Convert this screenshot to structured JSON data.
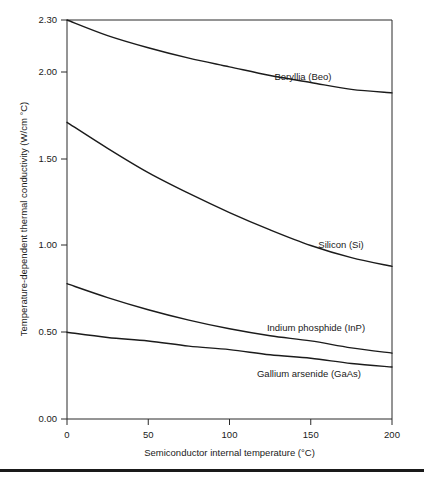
{
  "chart_data": {
    "type": "line",
    "title": "",
    "xlabel": "Semiconductor internal temperature (°C)",
    "ylabel": "Temperature-dependent thermal conductivity (W/cm °C)",
    "xlim": [
      0,
      200
    ],
    "ylim": [
      0.0,
      2.3
    ],
    "grid": false,
    "legend_position": "inline-right-of-curve",
    "xticks": [
      0,
      50,
      100,
      150,
      200
    ],
    "xtick_labels": [
      "0",
      "50",
      "100",
      "150",
      "200"
    ],
    "yticks": [
      0.0,
      0.5,
      1.0,
      1.5,
      2.0,
      2.3
    ],
    "ytick_labels": [
      "0.00",
      "0.50",
      "1.00",
      "1.50",
      "2.00",
      "2.30"
    ],
    "x": [
      0,
      25,
      50,
      75,
      100,
      125,
      150,
      175,
      200
    ],
    "series": [
      {
        "name": "Beryllia (Beo)",
        "label": "Beryllia (Beo)",
        "values": [
          2.3,
          2.21,
          2.14,
          2.08,
          2.03,
          1.98,
          1.94,
          1.9,
          1.88
        ]
      },
      {
        "name": "Silicon (Si)",
        "label": "Silicon (Si)",
        "values": [
          1.71,
          1.56,
          1.42,
          1.3,
          1.19,
          1.09,
          1.0,
          0.93,
          0.88
        ]
      },
      {
        "name": "Indium phosphide (InP)",
        "label": "Indium phosphide (InP)",
        "values": [
          0.78,
          0.7,
          0.63,
          0.57,
          0.52,
          0.48,
          0.45,
          0.41,
          0.38
        ]
      },
      {
        "name": "Gallium arsenide (GaAs)",
        "label": "Gallium arsenide (GaAs)",
        "values": [
          0.5,
          0.47,
          0.45,
          0.42,
          0.4,
          0.37,
          0.35,
          0.32,
          0.3
        ]
      }
    ]
  },
  "axes": {
    "x_title": "Semiconductor internal temperature (°C)",
    "y_title": "Temperature-dependent thermal conductivity (W/cm °C)"
  },
  "ytick_labels": {
    "t0": "0.00",
    "t1": "0.50",
    "t2": "1.00",
    "t3": "1.50",
    "t4": "2.00",
    "t5": "2.30"
  },
  "xtick_labels": {
    "t0": "0",
    "t1": "50",
    "t2": "100",
    "t3": "150",
    "t4": "200"
  },
  "series_labels": {
    "beryllia": "Beryllia (Beo)",
    "silicon": "Silicon (Si)",
    "indium_phosphide": "Indium phosphide (InP)",
    "gallium_arsenide": "Gallium arsenide (GaAs)"
  },
  "colors": {
    "line": "#1b1b1b",
    "axis": "#2b2b2b",
    "text": "#1a1a1a",
    "background": "#ffffff"
  }
}
